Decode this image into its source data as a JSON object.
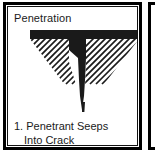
{
  "panel": {
    "title": "Penetration",
    "caption_line1": "1. Penetrant Seeps",
    "caption_line2": "Into Crack",
    "border_color": "#000000",
    "background_color": "#ffffff",
    "ink_color": "#1a1a1a"
  },
  "figure": {
    "name": "penetrant-seeping-into-crack-diagram",
    "surface_band": {
      "label": "penetrant-surface-layer",
      "fill": "#1a1a1a",
      "x": 22,
      "y": 2,
      "width": 109,
      "height": 9
    },
    "crack": {
      "label": "tapered-crack-filled-with-penetrant",
      "fill": "#1a1a1a",
      "mouth_left_x": 61,
      "mouth_right_x": 78,
      "mouth_y": 10,
      "tip_x": 74,
      "tip_y": 82
    },
    "hatching": {
      "label": "section-hatch-lines",
      "color": "#1a1a1a",
      "angle_deg": 45,
      "direction": "down-left",
      "stroke_width": 1.6,
      "spacing": 6,
      "left_lines": 10,
      "right_lines": 12
    },
    "outline": {
      "label": "material-inverted-triangle",
      "apex_x": 76,
      "apex_y": 82,
      "left_x": 22,
      "right_x": 131,
      "top_y": 11
    }
  },
  "adjacent_panel": {
    "label": "next-figure-panel-edge",
    "visible": true
  }
}
